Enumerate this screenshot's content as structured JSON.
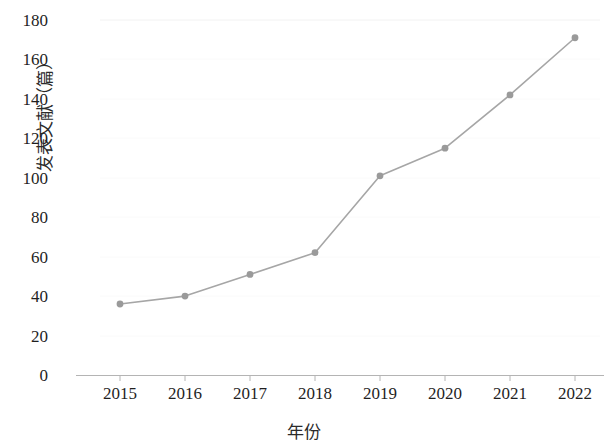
{
  "chart_data": {
    "type": "line",
    "title": "",
    "subtitle": "",
    "xlabel": "年份",
    "ylabel": "发表文献（篇）",
    "categories": [
      "2015",
      "2016",
      "2017",
      "2018",
      "2019",
      "2020",
      "2021",
      "2022"
    ],
    "x": [
      2015,
      2016,
      2017,
      2018,
      2019,
      2020,
      2021,
      2022
    ],
    "values": [
      36,
      40,
      51,
      62,
      101,
      115,
      142,
      171
    ],
    "series": [
      {
        "name": "发表文献（篇）",
        "values": [
          36,
          40,
          51,
          62,
          101,
          115,
          142,
          171
        ]
      }
    ],
    "ylim": [
      0,
      180
    ],
    "yticks": [
      0,
      20,
      40,
      60,
      80,
      100,
      120,
      140,
      160,
      180
    ],
    "ytick_labels": [
      "0",
      "20",
      "40",
      "60",
      "80",
      "100",
      "120",
      "140",
      "160",
      "180"
    ],
    "xtick_labels": [
      "2015",
      "2016",
      "2017",
      "2018",
      "2019",
      "2020",
      "2021",
      "2022"
    ],
    "grid": false,
    "legend": "none",
    "marker": "circle",
    "line_color": "#a6a6a6",
    "marker_color": "#9a9a9a",
    "axis_color": "#b0b0b0",
    "text_color": "#1f1f1f",
    "background_color": "#ffffff"
  }
}
